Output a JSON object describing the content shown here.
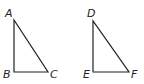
{
  "diagram": {
    "triangles": [
      {
        "name": "ABC",
        "vertices": [
          {
            "label": "A",
            "x": 14,
            "y": 20,
            "lx": 5,
            "ly": 17
          },
          {
            "label": "B",
            "x": 14,
            "y": 72,
            "lx": 3,
            "ly": 78
          },
          {
            "label": "C",
            "x": 48,
            "y": 72,
            "lx": 50,
            "ly": 78
          }
        ],
        "right_angle_at": "B"
      },
      {
        "name": "DEF",
        "vertices": [
          {
            "label": "D",
            "x": 93,
            "y": 21,
            "lx": 87,
            "ly": 17
          },
          {
            "label": "E",
            "x": 93,
            "y": 72,
            "lx": 83,
            "ly": 78
          },
          {
            "label": "F",
            "x": 129,
            "y": 72,
            "lx": 131,
            "ly": 78
          }
        ],
        "right_angle_at": "E"
      }
    ],
    "colors": {
      "stroke": "#222222",
      "background": "#ffffff"
    }
  }
}
